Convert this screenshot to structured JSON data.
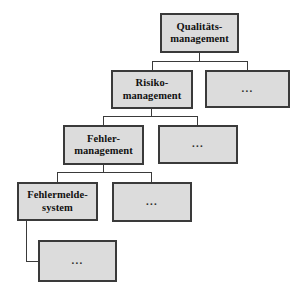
{
  "diagram": {
    "type": "tree",
    "background_color": "#ffffff",
    "node_fill_color": "#dcdcdc",
    "node_border_color": "#3a3a3a",
    "edge_color": "#3a3a3a",
    "levels": 5,
    "nodes": [
      {
        "id": "qualitaetsmanagement",
        "label": "Qualitäts-\nmanagement",
        "level": 0,
        "kind": "labeled",
        "x": 160,
        "y": 13,
        "w": 79,
        "h": 40
      },
      {
        "id": "risikomanagement",
        "label": "Risiko-\nmanagement",
        "level": 1,
        "kind": "labeled",
        "x": 111,
        "y": 70,
        "w": 82,
        "h": 39
      },
      {
        "id": "level1-more",
        "label": "...",
        "level": 1,
        "kind": "ellipsis",
        "x": 205,
        "y": 70,
        "w": 85,
        "h": 38
      },
      {
        "id": "fehlermanagement",
        "label": "Fehler-\nmanagement",
        "level": 2,
        "kind": "labeled",
        "x": 63,
        "y": 125,
        "w": 81,
        "h": 40
      },
      {
        "id": "level2-more",
        "label": "...",
        "level": 2,
        "kind": "ellipsis",
        "x": 158,
        "y": 125,
        "w": 80,
        "h": 39
      },
      {
        "id": "fehlermeldesystem",
        "label": "Fehlermelde-\nsystem",
        "level": 3,
        "kind": "labeled",
        "x": 17,
        "y": 182,
        "w": 81,
        "h": 39
      },
      {
        "id": "level3-more",
        "label": "...",
        "level": 3,
        "kind": "ellipsis",
        "x": 112,
        "y": 182,
        "w": 80,
        "h": 40
      },
      {
        "id": "level4-more",
        "label": "...",
        "level": 4,
        "kind": "ellipsis",
        "x": 38,
        "y": 240,
        "w": 79,
        "h": 42
      }
    ],
    "edges": [
      {
        "from": "qualitaetsmanagement",
        "to": "risikomanagement"
      },
      {
        "from": "qualitaetsmanagement",
        "to": "level1-more"
      },
      {
        "from": "risikomanagement",
        "to": "fehlermanagement"
      },
      {
        "from": "risikomanagement",
        "to": "level2-more"
      },
      {
        "from": "fehlermanagement",
        "to": "fehlermeldesystem"
      },
      {
        "from": "fehlermanagement",
        "to": "level3-more"
      },
      {
        "from": "fehlermeldesystem",
        "to": "level4-more"
      }
    ]
  }
}
